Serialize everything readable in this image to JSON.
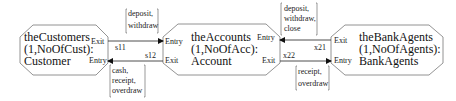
{
  "diagram": {
    "capsules": [
      {
        "id": "customers",
        "line1": "theCustomers",
        "line2": "(1,NoOfCust):",
        "line3": "Customer",
        "ports": {
          "exit": "Exit",
          "entry": "Entry"
        }
      },
      {
        "id": "accounts",
        "line1": "theAccounts",
        "line2": "(1,NoOfAcc):",
        "line3": "Account",
        "ports": {
          "entry": "Entry",
          "exit": "Exit"
        }
      },
      {
        "id": "agents",
        "line1": "theBankAgents",
        "line2": "(1,NoOfAgents):",
        "line3": "BankAgents",
        "ports": {
          "exit": "Exit",
          "entry": "Entry"
        }
      }
    ],
    "connections": [
      {
        "id": "s11",
        "label": "s11",
        "from": "theCustomers.Exit",
        "to": "theAccounts.Entry"
      },
      {
        "id": "s12",
        "label": "s12",
        "from": "theAccounts.Exit",
        "to": "theCustomers.Entry"
      },
      {
        "id": "x21",
        "label": "x21",
        "from": "theBankAgents.Exit",
        "to": "theAccounts.Entry"
      },
      {
        "id": "x22",
        "label": "x22",
        "from": "theAccounts.Exit",
        "to": "theBankAgents.Entry"
      }
    ],
    "messages": [
      {
        "attached_to": "s11",
        "lines": [
          "deposit,",
          "withdraw"
        ]
      },
      {
        "attached_to": "s12",
        "lines": [
          "cash,",
          "receipt,",
          "overdraw"
        ]
      },
      {
        "attached_to": "x21",
        "lines": [
          "deposit,",
          "withdraw,",
          "close"
        ]
      },
      {
        "attached_to": "x22",
        "lines": [
          "receipt,",
          "overdraw"
        ]
      }
    ]
  }
}
